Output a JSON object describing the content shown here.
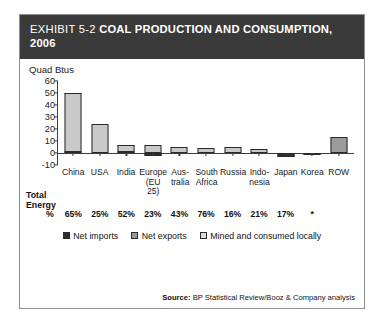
{
  "exhibit": {
    "eyebrow": "EXHIBIT 5-2",
    "title": "COAL PRODUCTION AND CONSUMPTION, 2006"
  },
  "total_energy": {
    "caption_line1": "Total",
    "caption_line2": "Energy",
    "unit": "%",
    "values": [
      "65%",
      "25%",
      "52%",
      "23%",
      "43%",
      "76%",
      "16%",
      "21%",
      "17%",
      "*",
      ""
    ]
  },
  "legend": {
    "items": [
      {
        "label": "Net imports",
        "color": "#2e2e2e"
      },
      {
        "label": "Net exports",
        "color": "#9b9b9b"
      },
      {
        "label": "Mined and consumed locally",
        "color": "#dcdcdc"
      }
    ]
  },
  "source": {
    "label": "Source:",
    "text": "BP Statistical Review/Booz & Company analysis"
  },
  "chart_data": {
    "type": "bar",
    "title": "COAL PRODUCTION AND CONSUMPTION, 2006",
    "xlabel": "",
    "ylabel": "Quad Btus",
    "ylim": [
      -10,
      60
    ],
    "yticks": [
      60,
      50,
      40,
      30,
      20,
      10,
      0,
      -10
    ],
    "grid": false,
    "legend_position": "bottom-center",
    "stacked": true,
    "categories": [
      "China",
      "USA",
      "India",
      "Europe (EU 25)",
      "Australia",
      "South Africa",
      "Russia",
      "Indonesia",
      "Japan",
      "Korea",
      "ROW"
    ],
    "category_lines": [
      [
        "China"
      ],
      [
        "USA"
      ],
      [
        "India"
      ],
      [
        "Europe",
        "(EU 25)"
      ],
      [
        "Aus-",
        "tralia"
      ],
      [
        "South",
        "Africa"
      ],
      [
        "Russia"
      ],
      [
        "Indo-",
        "nesia"
      ],
      [
        "Japan"
      ],
      [
        "Korea"
      ],
      [
        "ROW"
      ]
    ],
    "series": [
      {
        "name": "Net imports",
        "color": "#2e2e2e",
        "values": [
          1.5,
          0,
          1.0,
          -2.5,
          0,
          0,
          0,
          0,
          -4.0,
          -2.2,
          0
        ]
      },
      {
        "name": "Net exports",
        "color": "#9b9b9b",
        "values": [
          0,
          0,
          0,
          0,
          0,
          0,
          0,
          0,
          0,
          0,
          13.0
        ]
      },
      {
        "name": "Mined and consumed locally",
        "color": "#c9c9c9",
        "values": [
          48.5,
          23.5,
          5.0,
          6.0,
          5.0,
          4.0,
          4.5,
          3.0,
          0,
          0,
          0
        ]
      }
    ],
    "totals": [
      50,
      23.5,
      6,
      6,
      5,
      4,
      4.5,
      3,
      -4,
      -2.2,
      13
    ],
    "annotations": {
      "total_energy_share_label": "Total Energy %",
      "total_energy_share": [
        "65%",
        "25%",
        "52%",
        "23%",
        "43%",
        "76%",
        "16%",
        "21%",
        "17%",
        "*",
        ""
      ]
    }
  }
}
